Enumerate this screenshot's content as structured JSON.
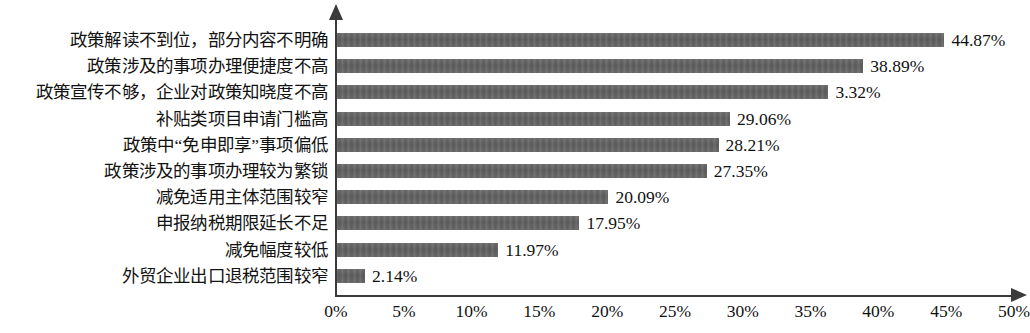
{
  "chart_data": {
    "type": "bar",
    "orientation": "horizontal",
    "title": "",
    "xlabel": "",
    "ylabel": "",
    "xlim": [
      0,
      50
    ],
    "xtick_labels": [
      "0%",
      "5%",
      "10%",
      "15%",
      "20%",
      "25%",
      "30%",
      "35%",
      "40%",
      "45%",
      "50%"
    ],
    "xtick_values": [
      0,
      5,
      10,
      15,
      20,
      25,
      30,
      35,
      40,
      45,
      50
    ],
    "grid": false,
    "legend": false,
    "bar_color": "#636363",
    "axis_color": "#3b3b3b",
    "categories": [
      "政策解读不到位，部分内容不明确",
      "政策涉及的事项办理便捷度不高",
      "政策宣传不够，企业对政策知晓度不高",
      "补贴类项目申请门槛高",
      "政策中“免申即享”事项偏低",
      "政策涉及的事项办理较为繁锁",
      "减免适用主体范围较窄",
      "申报纳税期限延长不足",
      "减免幅度较低",
      "外贸企业出口退税范围较窄"
    ],
    "values": [
      44.87,
      38.89,
      36.32,
      29.06,
      28.21,
      27.35,
      20.09,
      17.95,
      11.97,
      2.14
    ],
    "value_labels": [
      "44.87%",
      "38.89%",
      "3.32%",
      "29.06%",
      "28.21%",
      "27.35%",
      "20.09%",
      "17.95%",
      "11.97%",
      "2.14%"
    ]
  }
}
